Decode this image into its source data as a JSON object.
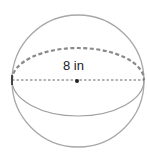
{
  "diagram": {
    "type": "sphere",
    "label": "8 in",
    "measurement": "diameter",
    "colors": {
      "outline": "#a0a0a0",
      "dashed_back_equator": "#909090",
      "diameter_line": "#555555",
      "center_point": "#222222",
      "label_text": "#222222"
    }
  }
}
